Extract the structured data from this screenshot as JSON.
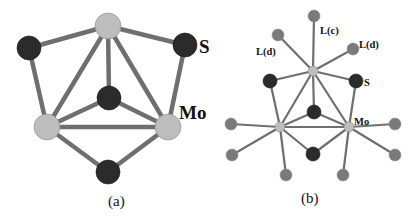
{
  "colors": {
    "mo": "#bdbdbd",
    "s": "#2b2b2b",
    "ligand": "#7a7a7a",
    "bond": "#6f6f6f",
    "label": "#111111"
  },
  "panel_a": {
    "caption": "(a)",
    "labels": {
      "s": "S",
      "mo": "Mo"
    },
    "atoms": [
      {
        "id": "mo_top",
        "type": "mo",
        "x": 108,
        "y": 26,
        "r": 13
      },
      {
        "id": "mo_bl",
        "type": "mo",
        "x": 47,
        "y": 127,
        "r": 13
      },
      {
        "id": "mo_br",
        "type": "mo",
        "x": 168,
        "y": 127,
        "r": 13
      },
      {
        "id": "s_left",
        "type": "s",
        "x": 29,
        "y": 48,
        "r": 12
      },
      {
        "id": "s_right",
        "type": "s",
        "x": 185,
        "y": 45,
        "r": 12
      },
      {
        "id": "s_center",
        "type": "s",
        "x": 109,
        "y": 98,
        "r": 12
      },
      {
        "id": "s_bottom",
        "type": "s",
        "x": 108,
        "y": 172,
        "r": 12
      }
    ],
    "bonds": [
      [
        "mo_top",
        "s_left"
      ],
      [
        "mo_top",
        "s_right"
      ],
      [
        "mo_top",
        "s_center"
      ],
      [
        "mo_top",
        "mo_bl"
      ],
      [
        "mo_top",
        "mo_br"
      ],
      [
        "mo_bl",
        "mo_br"
      ],
      [
        "s_left",
        "mo_bl"
      ],
      [
        "s_right",
        "mo_br"
      ],
      [
        "s_center",
        "mo_bl"
      ],
      [
        "s_center",
        "mo_br"
      ],
      [
        "s_bottom",
        "mo_bl"
      ],
      [
        "s_bottom",
        "mo_br"
      ]
    ]
  },
  "panel_b": {
    "caption": "(b)",
    "labels": {
      "lc": "L(c)",
      "ld_left": "L(d)",
      "ld_right": "L(d)",
      "s": "S",
      "mo": "Mo"
    },
    "atoms": [
      {
        "id": "mo_top",
        "type": "mo",
        "x": 313,
        "y": 71,
        "r": 5
      },
      {
        "id": "mo_l",
        "type": "mo",
        "x": 280,
        "y": 127,
        "r": 5
      },
      {
        "id": "mo_r",
        "type": "mo",
        "x": 349,
        "y": 127,
        "r": 5
      },
      {
        "id": "s_left",
        "type": "s",
        "x": 270,
        "y": 81,
        "r": 7
      },
      {
        "id": "s_right",
        "type": "s",
        "x": 356,
        "y": 81,
        "r": 7
      },
      {
        "id": "s_center",
        "type": "s",
        "x": 314,
        "y": 112,
        "r": 7
      },
      {
        "id": "s_bottom",
        "type": "s",
        "x": 313,
        "y": 154,
        "r": 7
      },
      {
        "id": "l_c",
        "type": "ligand",
        "x": 314,
        "y": 16,
        "r": 6
      },
      {
        "id": "l_d_left",
        "type": "ligand",
        "x": 278,
        "y": 35,
        "r": 6
      },
      {
        "id": "l_d_right",
        "type": "ligand",
        "x": 353,
        "y": 49,
        "r": 6
      },
      {
        "id": "l_l1",
        "type": "ligand",
        "x": 231,
        "y": 124,
        "r": 6
      },
      {
        "id": "l_l2",
        "type": "ligand",
        "x": 232,
        "y": 155,
        "r": 6
      },
      {
        "id": "l_b1",
        "type": "ligand",
        "x": 286,
        "y": 175,
        "r": 6
      },
      {
        "id": "l_b2",
        "type": "ligand",
        "x": 343,
        "y": 175,
        "r": 6
      },
      {
        "id": "l_r1",
        "type": "ligand",
        "x": 395,
        "y": 124,
        "r": 6
      },
      {
        "id": "l_r2",
        "type": "ligand",
        "x": 395,
        "y": 155,
        "r": 6
      }
    ],
    "bonds": [
      [
        "mo_top",
        "s_left"
      ],
      [
        "mo_top",
        "s_right"
      ],
      [
        "mo_top",
        "s_center"
      ],
      [
        "mo_top",
        "mo_l"
      ],
      [
        "mo_top",
        "mo_r"
      ],
      [
        "mo_l",
        "mo_r"
      ],
      [
        "s_left",
        "mo_l"
      ],
      [
        "s_right",
        "mo_r"
      ],
      [
        "s_center",
        "mo_l"
      ],
      [
        "s_center",
        "mo_r"
      ],
      [
        "s_bottom",
        "mo_l"
      ],
      [
        "s_bottom",
        "mo_r"
      ],
      [
        "mo_top",
        "l_c"
      ],
      [
        "mo_top",
        "l_d_left"
      ],
      [
        "mo_top",
        "l_d_right"
      ],
      [
        "mo_l",
        "l_l1"
      ],
      [
        "mo_l",
        "l_l2"
      ],
      [
        "mo_l",
        "l_b1"
      ],
      [
        "mo_r",
        "l_b2"
      ],
      [
        "mo_r",
        "l_r1"
      ],
      [
        "mo_r",
        "l_r2"
      ]
    ]
  }
}
